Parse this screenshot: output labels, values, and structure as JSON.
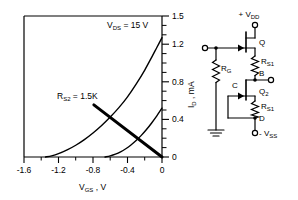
{
  "chart_data": {
    "type": "line",
    "title": "",
    "xlabel": "V",
    "xlabel_sub": "GS",
    "xlabel_full": "VGS , V",
    "ylabel": "I",
    "ylabel_sub": "D",
    "ylabel_full": "ID , mA",
    "xlim": [
      -1.6,
      0
    ],
    "ylim": [
      0,
      1.5
    ],
    "grid": false,
    "legend": "none",
    "xticks": [
      -1.6,
      -1.2,
      -0.8,
      -0.4,
      0
    ],
    "xticklabels": [
      "-1.6",
      "-1.2",
      "-0.8",
      "-0.4",
      "0"
    ],
    "xminorticks": [
      -1.4,
      -1.0,
      -0.6,
      -0.2
    ],
    "yticks": [
      0,
      0.4,
      0.8,
      1.2,
      1.5
    ],
    "yticklabels": [
      "0",
      "0.4",
      "0.8",
      "1.2",
      "1.5"
    ],
    "yminorticks": [
      0.1,
      0.2,
      0.3,
      0.5,
      0.6,
      0.7,
      0.9,
      1.0,
      1.1,
      1.3,
      1.4
    ],
    "annotations": [
      {
        "text": "VDS = 15 V",
        "base": "V",
        "sub": "DS",
        "rest": "= 15 V",
        "x": -0.52,
        "y": 1.33
      },
      {
        "text": "RS2 = 1.5K",
        "base": "R",
        "sub": "S2",
        "rest": "= 1.5K",
        "x": -1.02,
        "y": 0.7
      }
    ],
    "series": [
      {
        "name": "upper-transfer-curve",
        "style": "solid",
        "width": 1.4,
        "points": [
          [
            -1.35,
            0.0
          ],
          [
            -1.28,
            0.012
          ],
          [
            -1.2,
            0.035
          ],
          [
            -1.1,
            0.075
          ],
          [
            -1.0,
            0.125
          ],
          [
            -0.9,
            0.185
          ],
          [
            -0.8,
            0.255
          ],
          [
            -0.7,
            0.335
          ],
          [
            -0.6,
            0.425
          ],
          [
            -0.5,
            0.525
          ],
          [
            -0.4,
            0.64
          ],
          [
            -0.3,
            0.775
          ],
          [
            -0.2,
            0.925
          ],
          [
            -0.12,
            1.06
          ],
          [
            -0.06,
            1.165
          ],
          [
            0.0,
            1.27
          ]
        ]
      },
      {
        "name": "lower-transfer-curve",
        "style": "solid",
        "width": 1.4,
        "points": [
          [
            -0.66,
            0.0
          ],
          [
            -0.6,
            0.012
          ],
          [
            -0.54,
            0.03
          ],
          [
            -0.48,
            0.055
          ],
          [
            -0.42,
            0.088
          ],
          [
            -0.36,
            0.128
          ],
          [
            -0.3,
            0.175
          ],
          [
            -0.24,
            0.23
          ],
          [
            -0.18,
            0.292
          ],
          [
            -0.12,
            0.362
          ],
          [
            -0.06,
            0.438
          ],
          [
            0.0,
            0.52
          ]
        ]
      },
      {
        "name": "load-line",
        "style": "solid",
        "width": 3.0,
        "points": [
          [
            -0.79,
            0.555
          ],
          [
            0.0,
            0.0
          ]
        ]
      }
    ]
  },
  "circuit": {
    "name": "two-stage-jfet-circuit",
    "labels": {
      "vdd": "+ V",
      "vdd_sub": "DD",
      "vss": "- V",
      "vss_sub": "SS",
      "q1": "Q",
      "q2": "Q",
      "q2_sub": "2",
      "rg": "R",
      "rg_sub": "G",
      "rs1_top": "R",
      "rs1_top_sub": "S1",
      "rs1_bottom": "R",
      "rs1_bottom_sub": "S1",
      "node_b": "B",
      "node_c": "C",
      "node_d": "D"
    }
  }
}
